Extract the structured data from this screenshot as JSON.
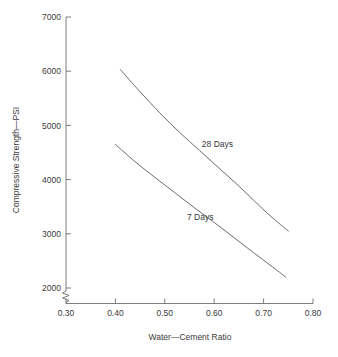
{
  "chart_data": {
    "type": "line",
    "title": "",
    "xlabel": "Water—Cement Ratio",
    "ylabel": "Compressive Strength—PSI",
    "xlim": [
      0.3,
      0.8
    ],
    "ylim": [
      2000,
      7000
    ],
    "grid": false,
    "legend_position": "inline-annotation",
    "axis_break": {
      "axis": "y",
      "style": "zigzag",
      "below_value": 2000
    },
    "xticks": [
      0.3,
      0.4,
      0.5,
      0.6,
      0.7,
      0.8
    ],
    "xtick_labels": [
      "0.30",
      "0.40",
      "0.50",
      "0.60",
      "0.70",
      "0.80"
    ],
    "yticks": [
      2000,
      3000,
      4000,
      5000,
      6000,
      7000
    ],
    "ytick_labels": [
      "2000",
      "3000",
      "4000",
      "5000",
      "6000",
      "7000"
    ],
    "series": [
      {
        "name": "28 Days",
        "label": "28 Days",
        "color": "#6b6b6b",
        "label_x": 0.575,
        "label_y": 4600,
        "x": [
          0.41,
          0.45,
          0.49,
          0.53,
          0.57,
          0.61,
          0.65,
          0.69,
          0.715,
          0.75
        ],
        "values": [
          6030,
          5620,
          5230,
          4870,
          4540,
          4210,
          3880,
          3530,
          3320,
          3050
        ]
      },
      {
        "name": "7 Days",
        "label": "7 Days",
        "color": "#6b6b6b",
        "label_x": 0.545,
        "label_y": 3250,
        "x": [
          0.4,
          0.44,
          0.48,
          0.52,
          0.56,
          0.6,
          0.64,
          0.68,
          0.715,
          0.745
        ],
        "values": [
          4650,
          4330,
          4040,
          3760,
          3480,
          3210,
          2930,
          2650,
          2410,
          2200
        ]
      }
    ]
  },
  "figure": {
    "background_color": "#ffffff",
    "axis_color": "#6e6e6e",
    "text_color": "#3a3a3a"
  }
}
